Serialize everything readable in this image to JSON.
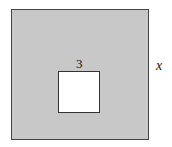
{
  "diagram": {
    "outer_square": {
      "side_label": "x",
      "fill": "#c8c8c8"
    },
    "inner_square": {
      "side_label": "3",
      "fill": "#ffffff"
    }
  }
}
